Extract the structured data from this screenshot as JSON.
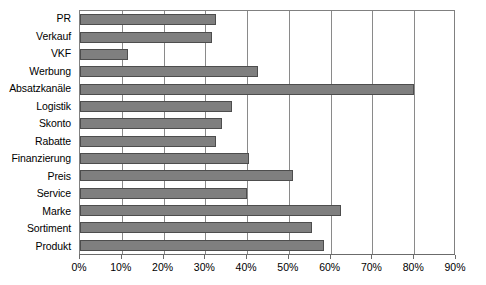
{
  "chart_data": {
    "type": "bar",
    "orientation": "horizontal",
    "title": "",
    "subtitle": "",
    "xlabel": "",
    "ylabel": "",
    "xlim": [
      0,
      90
    ],
    "xtick_labels": [
      "0%",
      "10%",
      "20%",
      "30%",
      "40%",
      "50%",
      "60%",
      "70%",
      "80%",
      "90%"
    ],
    "xtick_values": [
      0,
      10,
      20,
      30,
      40,
      50,
      60,
      70,
      80,
      90
    ],
    "grid": "vertical",
    "legend": "none",
    "unit": "%",
    "bar_color": "#7f7f7f",
    "bar_border_color": "#4d4d4d",
    "grid_color": "#8a8a8a",
    "axis_color": "#6b6b6b",
    "background_color": "#ffffff",
    "categories": [
      "PR",
      "Verkauf",
      "VKF",
      "Werbung",
      "Absatzkanäle",
      "Logistik",
      "Skonto",
      "Rabatte",
      "Finanzierung",
      "Preis",
      "Service",
      "Marke",
      "Sortiment",
      "Produkt"
    ],
    "values": [
      32.5,
      31.5,
      11.5,
      42.5,
      80.0,
      36.5,
      34.0,
      32.5,
      40.5,
      51.0,
      40.0,
      62.5,
      55.5,
      58.5
    ],
    "bars": [
      {
        "label": "PR",
        "value": 32.5
      },
      {
        "label": "Verkauf",
        "value": 31.5
      },
      {
        "label": "VKF",
        "value": 11.5
      },
      {
        "label": "Werbung",
        "value": 42.5
      },
      {
        "label": "Absatzkanäle",
        "value": 80.0
      },
      {
        "label": "Logistik",
        "value": 36.5
      },
      {
        "label": "Skonto",
        "value": 34.0
      },
      {
        "label": "Rabatte",
        "value": 32.5
      },
      {
        "label": "Finanzierung",
        "value": 40.5
      },
      {
        "label": "Preis",
        "value": 51.0
      },
      {
        "label": "Service",
        "value": 40.0
      },
      {
        "label": "Marke",
        "value": 62.5
      },
      {
        "label": "Sortiment",
        "value": 55.5
      },
      {
        "label": "Produkt",
        "value": 58.5
      }
    ]
  }
}
